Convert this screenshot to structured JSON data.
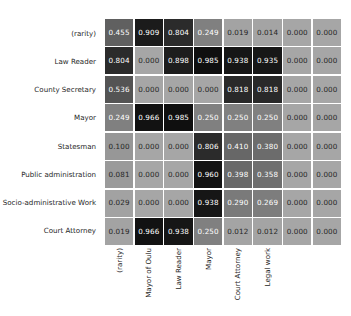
{
  "chart_data": {
    "type": "heatmap",
    "title": "",
    "xlabel": "",
    "ylabel": "",
    "colormap": "gray_r",
    "value_format": "0.000",
    "grid": true,
    "legend": "none",
    "vmin": 0.0,
    "vmax": 1.0,
    "row_labels": [
      "(rarity)",
      "Law Reader",
      "County Secretary",
      "Mayor",
      "Statesman",
      "Public administration",
      "Socio-administrative Work",
      "Court Attorney"
    ],
    "col_labels": [
      "(rarity)",
      "Mayor of Oulu",
      "Law Reader",
      "Mayor",
      "Court Attorney",
      "Legal work",
      "",
      ""
    ],
    "values": [
      [
        0.455,
        0.909,
        0.804,
        0.249,
        0.019,
        0.014,
        0.0,
        0.0
      ],
      [
        0.804,
        0.0,
        0.898,
        0.985,
        0.938,
        0.935,
        0.0,
        0.0
      ],
      [
        0.536,
        0.0,
        0.0,
        0.0,
        0.818,
        0.818,
        0.0,
        0.0
      ],
      [
        0.249,
        0.966,
        0.985,
        0.25,
        0.25,
        0.25,
        0.0,
        0.0
      ],
      [
        0.1,
        0.0,
        0.0,
        0.806,
        0.41,
        0.38,
        0.0,
        0.0
      ],
      [
        0.081,
        0.0,
        0.0,
        0.96,
        0.398,
        0.358,
        0.0,
        0.0
      ],
      [
        0.029,
        0.0,
        0.0,
        0.938,
        0.29,
        0.269,
        0.0,
        0.0
      ],
      [
        0.019,
        0.966,
        0.938,
        0.25,
        0.012,
        0.012,
        0.0,
        0.0
      ]
    ],
    "cell_text": [
      [
        "0.455",
        "0.909",
        "0.804",
        "0.249",
        "0.019",
        "0.014",
        "0.000",
        "0.000"
      ],
      [
        "0.804",
        "0.000",
        "0.898",
        "0.985",
        "0.938",
        "0.935",
        "0.000",
        "0.000"
      ],
      [
        "0.536",
        "0.000",
        "0.000",
        "0.000",
        "0.818",
        "0.818",
        "0.000",
        "0.000"
      ],
      [
        "0.249",
        "0.966",
        "0.985",
        "0.250",
        "0.250",
        "0.250",
        "0.000",
        "0.000"
      ],
      [
        "0.100",
        "0.000",
        "0.000",
        "0.806",
        "0.410",
        "0.380",
        "0.000",
        "0.000"
      ],
      [
        "0.081",
        "0.000",
        "0.000",
        "0.960",
        "0.398",
        "0.358",
        "0.000",
        "0.000"
      ],
      [
        "0.029",
        "0.000",
        "0.000",
        "0.938",
        "0.290",
        "0.269",
        "0.000",
        "0.000"
      ],
      [
        "0.019",
        "0.966",
        "0.938",
        "0.250",
        "0.012",
        "0.012",
        "0.000",
        "0.000"
      ]
    ],
    "colors": {
      "background": "#ffffff",
      "text_dark": "#262626",
      "text_light": "#ffffff",
      "cell_low": "#a6a6a6",
      "cell_high": "#0d0d0d"
    }
  }
}
